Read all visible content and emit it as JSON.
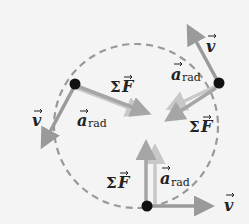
{
  "diagram": {
    "colors": {
      "background": "#f4f4f4",
      "circle": "#999999",
      "velocity": "#9a9a9a",
      "force": "#a6a6a6",
      "acceleration": "#c4c4c4",
      "particle": "#111111",
      "text": "#222222"
    },
    "labels": {
      "v": "v",
      "a": "a",
      "rad": "rad",
      "sigma": "Σ",
      "F": "F"
    },
    "points": [
      {
        "name": "left",
        "x": 75,
        "y": 84
      },
      {
        "name": "upper-right",
        "x": 219,
        "y": 83
      },
      {
        "name": "bottom",
        "x": 147,
        "y": 206
      }
    ]
  }
}
